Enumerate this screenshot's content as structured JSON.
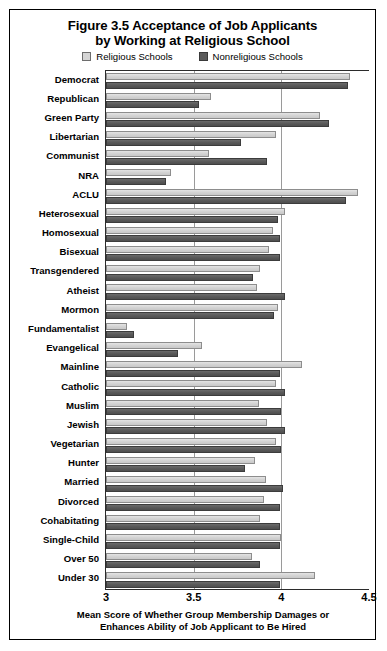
{
  "figure": {
    "title_line1": "Figure 3.5 Acceptance of Job Applicants",
    "title_line2": "by Working at Religious School",
    "xaxis_title_line1": "Mean Score of Whether Group Membership Damages or",
    "xaxis_title_line2": "Enhances Ability of Job Applicant to Be Hired"
  },
  "legend": {
    "items": [
      {
        "label": "Religious Schools",
        "color": "#d5d5d5",
        "swatch": "light-swatch-icon"
      },
      {
        "label": "Nonreligious Schools",
        "color": "#5b5b5b",
        "swatch": "dark-swatch-icon"
      }
    ]
  },
  "chart_data": {
    "type": "bar",
    "orientation": "horizontal",
    "title": "Figure 3.5 Acceptance of Job Applicants by Working at Religious School",
    "xlabel": "Mean Score of Whether Group Membership Damages or Enhances Ability of Job Applicant to Be Hired",
    "ylabel": "",
    "xlim": [
      3,
      4.5
    ],
    "xticks": [
      "3",
      "3.5",
      "4",
      "4.5"
    ],
    "xtick_values": [
      3,
      3.5,
      4,
      4.5
    ],
    "grid": true,
    "legend_position": "top",
    "categories": [
      "Democrat",
      "Republican",
      "Green Party",
      "Libertarian",
      "Communist",
      "NRA",
      "ACLU",
      "Heterosexual",
      "Homosexual",
      "Bisexual",
      "Transgendered",
      "Atheist",
      "Mormon",
      "Fundamentalist",
      "Evangelical",
      "Mainline",
      "Catholic",
      "Muslim",
      "Jewish",
      "Vegetarian",
      "Hunter",
      "Married",
      "Divorced",
      "Cohabitating",
      "Single-Child",
      "Over 50",
      "Under 30"
    ],
    "series": [
      {
        "name": "Religious Schools",
        "color": "#d5d5d5",
        "values": [
          4.39,
          3.6,
          4.22,
          3.97,
          3.59,
          3.37,
          4.44,
          4.02,
          3.95,
          3.93,
          3.88,
          3.86,
          3.98,
          3.12,
          3.55,
          4.12,
          3.97,
          3.87,
          3.92,
          3.97,
          3.85,
          3.91,
          3.9,
          3.88,
          4.0,
          3.83,
          4.19
        ]
      },
      {
        "name": "Nonreligious Schools",
        "color": "#5b5b5b",
        "values": [
          4.38,
          3.53,
          4.27,
          3.77,
          3.92,
          3.34,
          4.37,
          3.98,
          3.99,
          3.99,
          3.84,
          4.02,
          3.96,
          3.16,
          3.41,
          3.99,
          4.02,
          4.0,
          4.02,
          4.0,
          3.79,
          4.01,
          3.99,
          3.99,
          3.99,
          3.88,
          3.99
        ]
      }
    ]
  }
}
